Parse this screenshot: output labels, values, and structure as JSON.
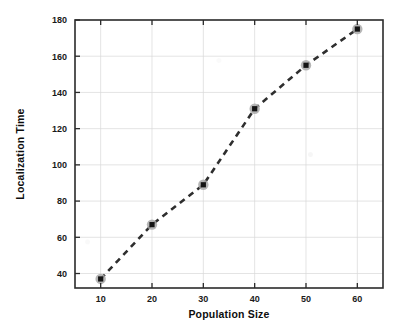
{
  "chart_data": {
    "type": "scatter",
    "title": "",
    "xlabel": "Population Size",
    "ylabel": "Localization Time",
    "x": [
      10,
      20,
      30,
      40,
      50,
      60
    ],
    "values": [
      37,
      67,
      89,
      131,
      155,
      175
    ],
    "series": [
      {
        "name": "Localization Time",
        "values": [
          37,
          67,
          89,
          131,
          155,
          175
        ],
        "line_style": "dashed",
        "marker": "square",
        "color": "#2e2e2e"
      }
    ],
    "xlim": [
      5,
      65
    ],
    "ylim": [
      32,
      180
    ],
    "xticks": [
      10,
      20,
      30,
      40,
      50,
      60
    ],
    "yticks": [
      40,
      60,
      80,
      100,
      120,
      140,
      160,
      180
    ],
    "xtick_labels": [
      "10",
      "20",
      "30",
      "40",
      "50",
      "60"
    ],
    "ytick_labels": [
      "40",
      "60",
      "80",
      "100",
      "120",
      "140",
      "160",
      "180"
    ],
    "grid": true,
    "legend": null,
    "legend_position": "none",
    "annotations": []
  },
  "figure": {
    "background_color": "#ffffff",
    "frame_color": "#2b2b2b",
    "grid_color": "#d8d8d8",
    "marker_core_color": "#141414",
    "marker_halo_color": "#a9a9a9"
  }
}
